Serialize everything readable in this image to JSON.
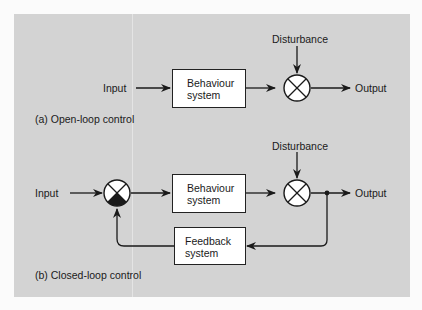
{
  "diagram": {
    "open_loop": {
      "caption": "(a) Open-loop control",
      "input_label": "Input",
      "box": {
        "line1": "Behaviour",
        "line2": "system"
      },
      "disturbance_label": "Disturbance",
      "output_label": "Output"
    },
    "closed_loop": {
      "caption": "(b) Closed-loop control",
      "input_label": "Input",
      "box": {
        "line1": "Behaviour",
        "line2": "system"
      },
      "feedback_box": {
        "line1": "Feedback",
        "line2": "system"
      },
      "disturbance_label": "Disturbance",
      "output_label": "Output"
    },
    "colors": {
      "panel": "#d3d3d3",
      "line": "#1a1a1a",
      "box_fill": "#ffffff"
    }
  }
}
